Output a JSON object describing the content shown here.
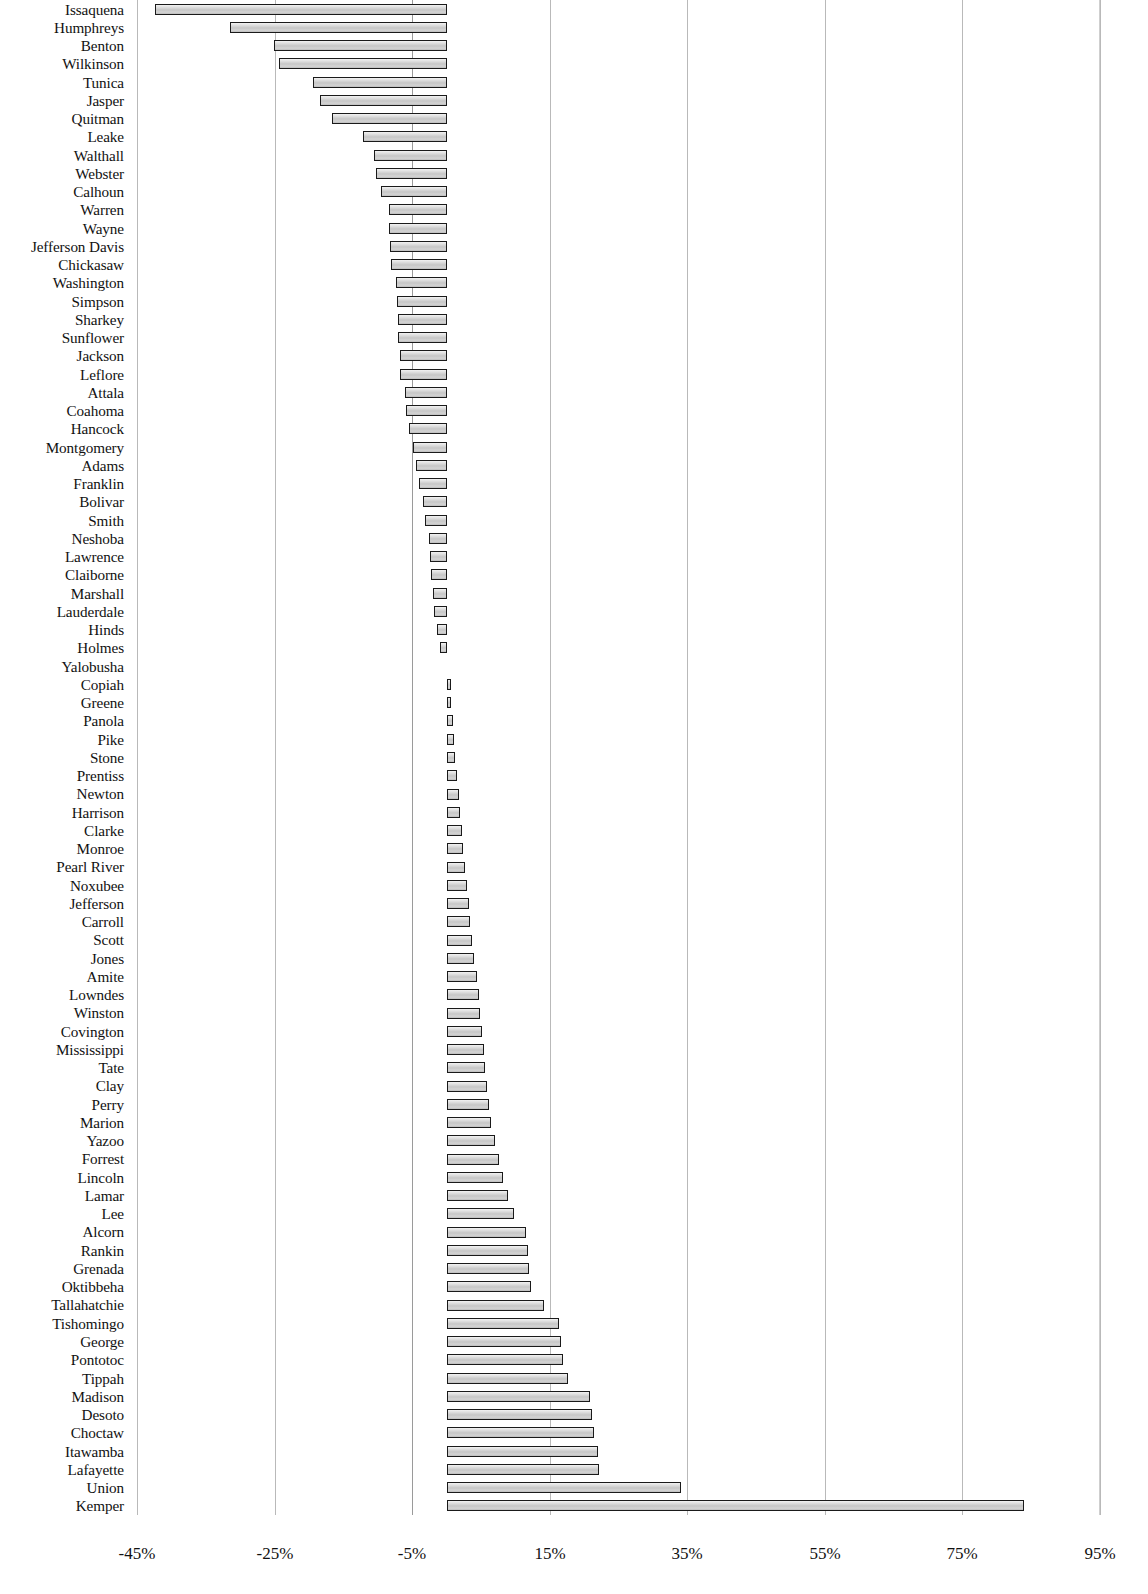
{
  "chart_data": {
    "type": "bar",
    "orientation": "horizontal",
    "title": "",
    "subtitle": "",
    "xlabel": "",
    "ylabel": "",
    "xlim": [
      -45,
      95
    ],
    "xticks": [
      -45,
      -25,
      -5,
      15,
      35,
      55,
      75,
      95
    ],
    "xtick_labels": [
      "-45%",
      "-25%",
      "-5%",
      "15%",
      "35%",
      "55%",
      "75%",
      "95%"
    ],
    "grid": true,
    "legend": null,
    "value_unit": "percent",
    "categories": [
      "Issaquena",
      "Humphreys",
      "Benton",
      "Wilkinson",
      "Tunica",
      "Jasper",
      "Quitman",
      "Leake",
      "Walthall",
      "Webster",
      "Calhoun",
      "Warren",
      "Wayne",
      "Jefferson Davis",
      "Chickasaw",
      "Washington",
      "Simpson",
      "Sharkey",
      "Sunflower",
      "Jackson",
      "Leflore",
      "Attala",
      "Coahoma",
      "Hancock",
      "Montgomery",
      "Adams",
      "Franklin",
      "Bolivar",
      "Smith",
      "Neshoba",
      "Lawrence",
      "Claiborne",
      "Marshall",
      "Lauderdale",
      "Hinds",
      "Holmes",
      "Yalobusha",
      "Copiah",
      "Greene",
      "Panola",
      "Pike",
      "Stone",
      "Prentiss",
      "Newton",
      "Harrison",
      "Clarke",
      "Monroe",
      "Pearl River",
      "Noxubee",
      "Jefferson",
      "Carroll",
      "Scott",
      "Jones",
      "Amite",
      "Lowndes",
      "Winston",
      "Covington",
      "Mississippi",
      "Tate",
      "Clay",
      "Perry",
      "Marion",
      "Yazoo",
      "Forrest",
      "Lincoln",
      "Lamar",
      "Lee",
      "Alcorn",
      "Rankin",
      "Grenada",
      "Oktibbeha",
      "Tallahatchie",
      "Tishomingo",
      "George",
      "Pontotoc",
      "Tippah",
      "Madison",
      "Desoto",
      "Choctaw",
      "Itawamba",
      "Lafayette",
      "Union",
      "Kemper"
    ],
    "values": [
      -42.4,
      -31.5,
      -25.1,
      -24.4,
      -19.4,
      -18.4,
      -16.6,
      -12.1,
      -10.6,
      -10.3,
      -9.6,
      -8.4,
      -8.3,
      -8.2,
      -8.1,
      -7.3,
      -7.2,
      -7.1,
      -7.0,
      -6.8,
      -6.7,
      -6.1,
      -5.9,
      -5.5,
      -4.9,
      -4.4,
      -4.0,
      -3.4,
      -3.1,
      -2.6,
      -2.4,
      -2.2,
      -2.0,
      -1.8,
      -1.4,
      -0.9,
      0.0,
      0.6,
      0.7,
      0.9,
      1.1,
      1.3,
      1.5,
      1.8,
      2.0,
      2.2,
      2.4,
      2.7,
      3.0,
      3.2,
      3.4,
      3.7,
      4.0,
      4.4,
      4.7,
      4.9,
      5.2,
      5.4,
      5.6,
      5.9,
      6.2,
      6.5,
      7.0,
      7.6,
      8.2,
      9.0,
      9.8,
      11.6,
      11.9,
      12.0,
      12.3,
      14.2,
      16.3,
      16.7,
      17.0,
      17.6,
      20.9,
      21.2,
      21.4,
      22.0,
      22.1,
      34.1,
      84.0
    ]
  },
  "axis": {
    "tick_labels": [
      "-45%",
      "-25%",
      "-5%",
      "15%",
      "35%",
      "55%",
      "75%",
      "95%"
    ]
  }
}
